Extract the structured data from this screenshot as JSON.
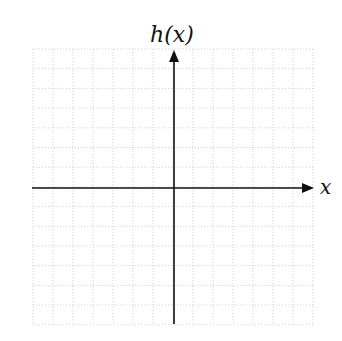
{
  "chart_data": {
    "type": "line",
    "title": "",
    "xlabel": "x",
    "ylabel": "h(x)",
    "grid": true,
    "grid_style": "dotted",
    "grid_color": "#c8c8c8",
    "axis_color": "#111111",
    "columns": 14,
    "rows": 14,
    "x_cells_left_of_origin": 7,
    "x_cells_right_of_origin": 7,
    "y_cells_above_origin": 7,
    "y_cells_below_origin": 7,
    "tick_labels": false,
    "series": []
  },
  "layout": {
    "grid_left": 33,
    "grid_top": 49,
    "cell_w": 20,
    "cell_h": 19.7,
    "origin_x": 174,
    "origin_y": 188,
    "x_axis_start": 32,
    "x_axis_end": 314,
    "y_axis_top": 50,
    "y_axis_bottom": 324
  },
  "labels": {
    "y_axis": "h(x)",
    "x_axis": "x"
  }
}
